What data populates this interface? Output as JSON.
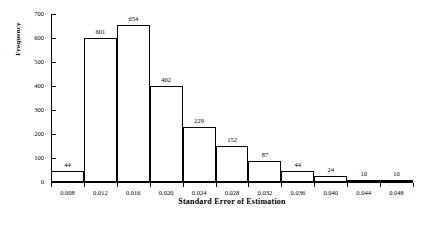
{
  "chart_data": {
    "type": "bar",
    "title": "",
    "xlabel": "Standard Error of Estimation",
    "ylabel": "Frequency",
    "categories": [
      "0.008",
      "0.012",
      "0.016",
      "0.020",
      "0.024",
      "0.028",
      "0.032",
      "0.036",
      "0.040",
      "0.044",
      "0.048"
    ],
    "values": [
      44,
      601,
      654,
      402,
      229,
      152,
      87,
      44,
      24,
      10,
      10
    ],
    "value_labels": [
      "44",
      "601",
      "654",
      "402",
      "229",
      "152",
      "87",
      "44",
      "24",
      "10",
      "10"
    ],
    "xtick_labels": [
      "0.008",
      "0.012",
      "0.016",
      "0.020",
      "0.024",
      "0.028",
      "0.032",
      "0.036",
      "0.040",
      "0.044",
      "0.048"
    ],
    "ytick_labels": [
      "0",
      "100",
      "200",
      "300",
      "400",
      "500",
      "600",
      "700"
    ],
    "ytick_values": [
      0,
      100,
      200,
      300,
      400,
      500,
      600,
      700
    ],
    "ylim": [
      0,
      700
    ],
    "grid": false,
    "legend": false,
    "bar_fill_color": "#ffffff",
    "bar_edge_color": "#000000",
    "axis_color": "#000000"
  }
}
